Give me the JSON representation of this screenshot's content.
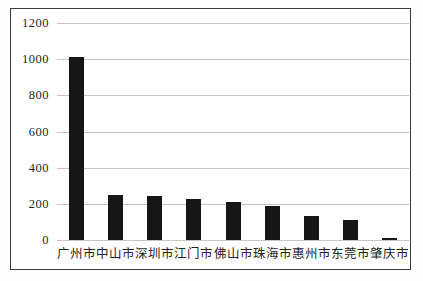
{
  "chart_data": {
    "type": "bar",
    "title": "",
    "xlabel": "",
    "ylabel": "",
    "categories": [
      "广州市",
      "中山市",
      "深圳市",
      "江门市",
      "佛山市",
      "珠海市",
      "惠州市",
      "东莞市",
      "肇庆市"
    ],
    "values": [
      1010,
      250,
      245,
      225,
      210,
      190,
      130,
      110,
      10
    ],
    "yticks": [
      0,
      200,
      400,
      600,
      800,
      1000,
      1200
    ],
    "ylim": [
      0,
      1200
    ],
    "grid": true,
    "gridline_orientation": "horizontal",
    "legend": false,
    "bar_color": "#161616",
    "gridline_color": "#c6c6c6",
    "frame_border_color": "#3a3a3a",
    "background_color": "#ffffff",
    "text_color": "#242424"
  }
}
